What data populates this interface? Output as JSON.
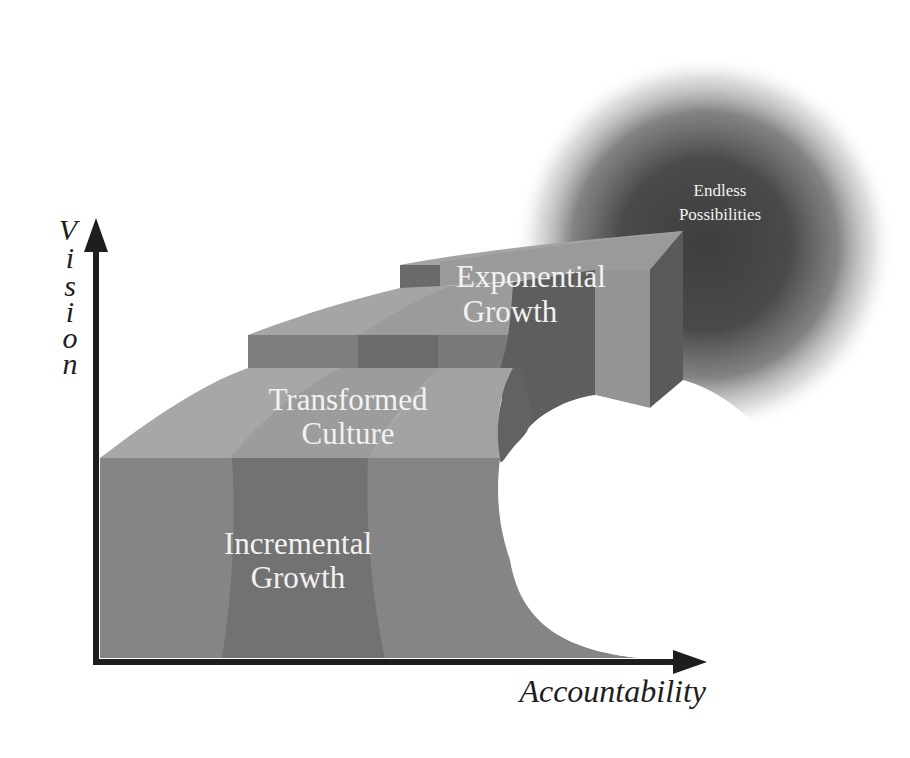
{
  "diagram": {
    "type": "staircase-growth-diagram",
    "axes": {
      "y_label_letters": [
        "V",
        "i",
        "s",
        "i",
        "o",
        "n"
      ],
      "y_label": "Vision",
      "x_label": "Accountability"
    },
    "stages": [
      {
        "id": "incremental",
        "line1": "Incremental",
        "line2": "Growth"
      },
      {
        "id": "transformed",
        "line1": "Transformed",
        "line2": "Culture"
      },
      {
        "id": "exponential",
        "line1": "Exponential",
        "line2": "Growth"
      }
    ],
    "goal": {
      "line1": "Endless",
      "line2": "Possibilities"
    },
    "colors": {
      "axis": "#1e1e1e",
      "front_light": "#8a8a8a",
      "front_mid": "#7a7a7a",
      "front_dark": "#6a6a6a",
      "top_light": "#a8a8a8",
      "top_mid": "#999999",
      "side_dark": "#5e5e5e",
      "glow": "#4a4a4a",
      "label": "#f2f2f2",
      "background": "#ffffff"
    }
  }
}
